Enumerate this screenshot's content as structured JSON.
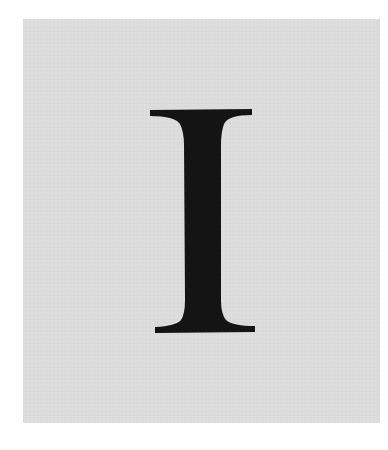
{
  "image": {
    "letter": "I",
    "colors": {
      "page_background": "#ffffff",
      "panel_background": "#dcdcdc",
      "glyph_fill": "#141414"
    }
  }
}
